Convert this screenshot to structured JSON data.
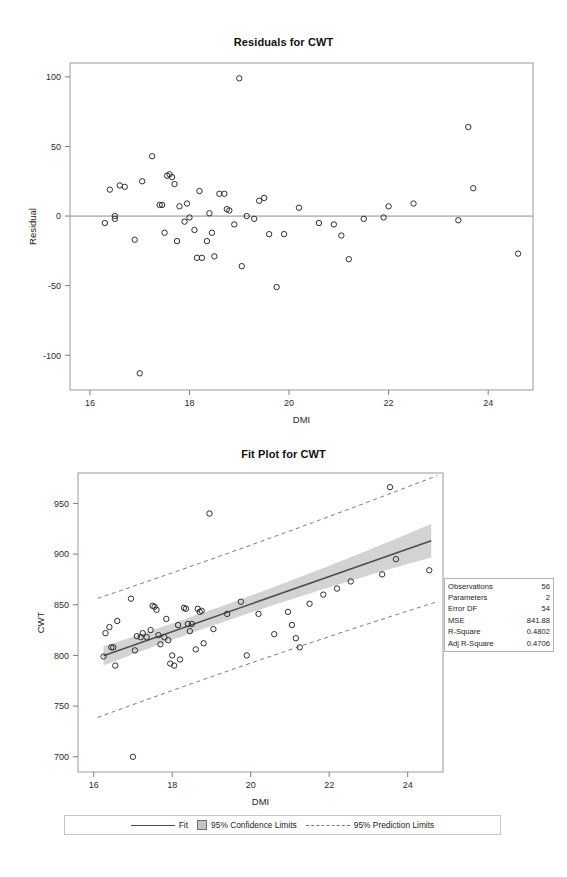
{
  "chart_data": [
    {
      "type": "scatter",
      "id": "residual-plot",
      "title": "Residuals for CWT",
      "xlabel": "DMI",
      "ylabel": "Residual",
      "xlim": [
        15.6,
        24.9
      ],
      "ylim": [
        -125,
        110
      ],
      "xticks": [
        16,
        18,
        20,
        22,
        24
      ],
      "yticks": [
        -100,
        -50,
        0,
        50,
        100
      ],
      "grid": false,
      "reference_line": 0,
      "marker": "open-circle",
      "points": [
        {
          "x": 16.3,
          "y": -5
        },
        {
          "x": 16.4,
          "y": 19
        },
        {
          "x": 16.5,
          "y": 0
        },
        {
          "x": 16.5,
          "y": -2
        },
        {
          "x": 16.6,
          "y": 22
        },
        {
          "x": 16.7,
          "y": 21
        },
        {
          "x": 16.9,
          "y": -17
        },
        {
          "x": 17.0,
          "y": -113
        },
        {
          "x": 17.05,
          "y": 25
        },
        {
          "x": 17.25,
          "y": 43
        },
        {
          "x": 17.4,
          "y": 8
        },
        {
          "x": 17.45,
          "y": 8
        },
        {
          "x": 17.5,
          "y": -12
        },
        {
          "x": 17.55,
          "y": 29
        },
        {
          "x": 17.6,
          "y": 30
        },
        {
          "x": 17.65,
          "y": 28
        },
        {
          "x": 17.7,
          "y": 23
        },
        {
          "x": 17.75,
          "y": -18
        },
        {
          "x": 17.8,
          "y": 7
        },
        {
          "x": 17.9,
          "y": -4
        },
        {
          "x": 17.95,
          "y": 9
        },
        {
          "x": 18.0,
          "y": -1
        },
        {
          "x": 18.1,
          "y": -10
        },
        {
          "x": 18.15,
          "y": -30
        },
        {
          "x": 18.2,
          "y": 18
        },
        {
          "x": 18.25,
          "y": -30
        },
        {
          "x": 18.35,
          "y": -18
        },
        {
          "x": 18.4,
          "y": 2
        },
        {
          "x": 18.45,
          "y": -12
        },
        {
          "x": 18.5,
          "y": -29
        },
        {
          "x": 18.6,
          "y": 16
        },
        {
          "x": 18.7,
          "y": 16
        },
        {
          "x": 18.75,
          "y": 5
        },
        {
          "x": 18.8,
          "y": 4
        },
        {
          "x": 18.9,
          "y": -6
        },
        {
          "x": 19.0,
          "y": 99
        },
        {
          "x": 19.05,
          "y": -36
        },
        {
          "x": 19.15,
          "y": 0
        },
        {
          "x": 19.3,
          "y": -2
        },
        {
          "x": 19.4,
          "y": 11
        },
        {
          "x": 19.5,
          "y": 13
        },
        {
          "x": 19.6,
          "y": -13
        },
        {
          "x": 19.75,
          "y": -51
        },
        {
          "x": 19.9,
          "y": -13
        },
        {
          "x": 20.2,
          "y": 6
        },
        {
          "x": 20.6,
          "y": -5
        },
        {
          "x": 20.9,
          "y": -6
        },
        {
          "x": 21.05,
          "y": -14
        },
        {
          "x": 21.2,
          "y": -31
        },
        {
          "x": 21.5,
          "y": -2
        },
        {
          "x": 21.9,
          "y": -1
        },
        {
          "x": 22.0,
          "y": 7
        },
        {
          "x": 22.5,
          "y": 9
        },
        {
          "x": 23.4,
          "y": -3
        },
        {
          "x": 23.6,
          "y": 64
        },
        {
          "x": 23.7,
          "y": 20
        },
        {
          "x": 24.6,
          "y": -27
        }
      ]
    },
    {
      "type": "scatter",
      "id": "fit-plot",
      "title": "Fit Plot for CWT",
      "xlabel": "DMI",
      "ylabel": "CWT",
      "xlim": [
        15.6,
        24.9
      ],
      "ylim": [
        685,
        980
      ],
      "xticks": [
        16,
        18,
        20,
        22,
        24
      ],
      "yticks": [
        700,
        750,
        800,
        850,
        900,
        950
      ],
      "grid": false,
      "marker": "open-circle",
      "fit": {
        "slope": 13.6,
        "intercept": 578.6,
        "x_start": 16.25,
        "x_end": 24.6,
        "y_start": 799.6,
        "y_end": 913.2
      },
      "confidence_band": {
        "level": 0.95,
        "half_width_center": 8.0,
        "half_width_edge": 16.5,
        "x_center": 18.7
      },
      "prediction_band": {
        "level": 0.95,
        "half_width_center": 58,
        "half_width_edge": 62
      },
      "points": [
        {
          "x": 16.25,
          "y": 799
        },
        {
          "x": 16.3,
          "y": 822
        },
        {
          "x": 16.4,
          "y": 828
        },
        {
          "x": 16.45,
          "y": 808
        },
        {
          "x": 16.5,
          "y": 808
        },
        {
          "x": 16.55,
          "y": 790
        },
        {
          "x": 16.6,
          "y": 834
        },
        {
          "x": 16.95,
          "y": 856
        },
        {
          "x": 17.0,
          "y": 700
        },
        {
          "x": 17.05,
          "y": 805
        },
        {
          "x": 17.1,
          "y": 819
        },
        {
          "x": 17.2,
          "y": 818
        },
        {
          "x": 17.25,
          "y": 822
        },
        {
          "x": 17.35,
          "y": 818
        },
        {
          "x": 17.45,
          "y": 825
        },
        {
          "x": 17.5,
          "y": 849
        },
        {
          "x": 17.55,
          "y": 848
        },
        {
          "x": 17.6,
          "y": 845
        },
        {
          "x": 17.65,
          "y": 820
        },
        {
          "x": 17.7,
          "y": 811
        },
        {
          "x": 17.8,
          "y": 818
        },
        {
          "x": 17.85,
          "y": 836
        },
        {
          "x": 17.9,
          "y": 815
        },
        {
          "x": 17.95,
          "y": 792
        },
        {
          "x": 18.0,
          "y": 800
        },
        {
          "x": 18.05,
          "y": 790
        },
        {
          "x": 18.15,
          "y": 830
        },
        {
          "x": 18.2,
          "y": 796
        },
        {
          "x": 18.3,
          "y": 847
        },
        {
          "x": 18.35,
          "y": 846
        },
        {
          "x": 18.4,
          "y": 831
        },
        {
          "x": 18.45,
          "y": 824
        },
        {
          "x": 18.5,
          "y": 831
        },
        {
          "x": 18.6,
          "y": 806
        },
        {
          "x": 18.65,
          "y": 846
        },
        {
          "x": 18.7,
          "y": 843
        },
        {
          "x": 18.75,
          "y": 844
        },
        {
          "x": 18.8,
          "y": 812
        },
        {
          "x": 18.95,
          "y": 940
        },
        {
          "x": 19.05,
          "y": 826
        },
        {
          "x": 19.4,
          "y": 841
        },
        {
          "x": 19.75,
          "y": 853
        },
        {
          "x": 19.9,
          "y": 800
        },
        {
          "x": 20.2,
          "y": 841
        },
        {
          "x": 20.6,
          "y": 821
        },
        {
          "x": 20.95,
          "y": 843
        },
        {
          "x": 21.05,
          "y": 830
        },
        {
          "x": 21.15,
          "y": 817
        },
        {
          "x": 21.25,
          "y": 808
        },
        {
          "x": 21.5,
          "y": 851
        },
        {
          "x": 21.85,
          "y": 860
        },
        {
          "x": 22.2,
          "y": 866
        },
        {
          "x": 22.55,
          "y": 873
        },
        {
          "x": 23.35,
          "y": 880
        },
        {
          "x": 23.55,
          "y": 966
        },
        {
          "x": 23.7,
          "y": 895
        },
        {
          "x": 24.55,
          "y": 884
        }
      ],
      "legend": {
        "position": "bottom",
        "entries": [
          {
            "label": "Fit",
            "style": "solid-line"
          },
          {
            "label": "95% Confidence Limits",
            "style": "filled-box"
          },
          {
            "label": "95% Prediction Limits",
            "style": "dashed-line"
          }
        ]
      },
      "stats": [
        {
          "name": "Observations",
          "value": "56"
        },
        {
          "name": "Parameters",
          "value": "2"
        },
        {
          "name": "Error DF",
          "value": "54"
        },
        {
          "name": "MSE",
          "value": "841.88"
        },
        {
          "name": "R-Square",
          "value": "0.4802"
        },
        {
          "name": "Adj R-Square",
          "value": "0.4706"
        }
      ]
    }
  ],
  "colors": {
    "fit_line": "#4d4d4d",
    "confidence_band": "#c4c4c4",
    "prediction_line": "#7a7a7a",
    "marker": "#2e2e2e",
    "frame": "#9a9a9a"
  }
}
